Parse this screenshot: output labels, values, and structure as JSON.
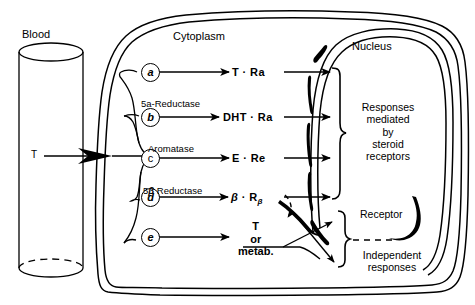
{
  "figure": {
    "regions": {
      "blood_label": "Blood",
      "cytoplasm_label": "Cytoplasm",
      "nucleus_label": "Nucleus",
      "receptor_label": "Receptor"
    },
    "hormone_input": "T",
    "pathways": [
      {
        "id": "a",
        "circle": "a",
        "italic": true,
        "enzyme": "",
        "product": "T · Ra",
        "enters_nucleus": true
      },
      {
        "id": "b",
        "circle": "b",
        "italic": true,
        "enzyme": "5a-Reductase",
        "product": "DHT · Ra",
        "enters_nucleus": true
      },
      {
        "id": "c",
        "circle": "c",
        "italic": false,
        "enzyme": "Aromatase",
        "product": "E · Re",
        "enters_nucleus": true
      },
      {
        "id": "d",
        "circle": "d",
        "italic": true,
        "enzyme": "5β Reductase",
        "product_main": "β · R",
        "product_sub": "β",
        "enters_nucleus": true
      },
      {
        "id": "e",
        "circle": "e",
        "italic": true,
        "enzyme": "",
        "product_lines": [
          "T",
          "or",
          "metab."
        ],
        "enters_nucleus": false
      }
    ],
    "nucleus_response": "Responses mediated by steroid receptors",
    "nucleus_response_lines": [
      "Responses",
      "mediated",
      "by",
      "steroid",
      "receptors"
    ],
    "independent_response_lines": [
      "Independent",
      "responses"
    ],
    "colors": {
      "ink": "#000000",
      "paper": "#ffffff"
    }
  }
}
